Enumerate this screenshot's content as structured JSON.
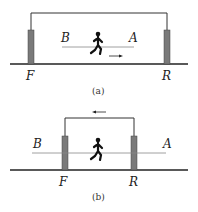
{
  "panels": [
    {
      "id": "a",
      "caption": "(a)",
      "labels": {
        "left_point": "B",
        "right_point": "A",
        "left_post": "F",
        "right_post": "R"
      },
      "arrow_direction": "right"
    },
    {
      "id": "b",
      "caption": "(b)",
      "labels": {
        "left_point": "B",
        "right_point": "A",
        "left_post": "F",
        "right_post": "R"
      },
      "arrow_direction": "left"
    }
  ],
  "colors": {
    "post": "#7a7a7a",
    "line": "#222222",
    "thin_line": "#888888"
  }
}
